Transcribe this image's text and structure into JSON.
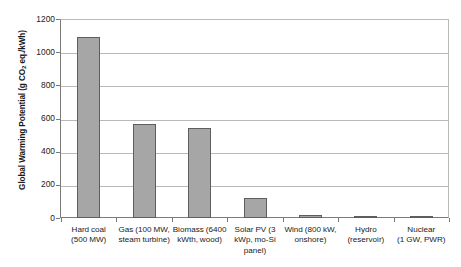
{
  "chart_data": {
    "type": "bar",
    "title": "",
    "subtitle": "",
    "xlabel": "",
    "ylabel": "Global Warming Potential (g CO2 eq./kWh)",
    "ylabel_parts": {
      "before": "Global Warming Potential (g CO",
      "subscript": "2",
      "after": " eq./kWh)"
    },
    "categories": [
      "Hard coal (500 MW)",
      "Gas (100 MW, steam turbine)",
      "Biomass (6400 kWth, wood)",
      "Solar PV (3 kWp, mo-Si panel)",
      "Wind (800 kW, onshore)",
      "Hydro (reservoir)",
      "Nuclear (1 GW, PWR)"
    ],
    "category_lines": [
      [
        "Hard coal",
        "(500 MW)"
      ],
      [
        "Gas (100 MW,",
        "steam turbine)"
      ],
      [
        "Biomass (6400",
        "kWth, wood)"
      ],
      [
        "Solar PV (3",
        "kWp, mo-Si",
        "panel)"
      ],
      [
        "Wind (800 kW,",
        "onshore)"
      ],
      [
        "Hydro",
        "(reservoir)"
      ],
      [
        "Nuclear",
        "(1 GW, PWR)"
      ]
    ],
    "values": [
      1091,
      565,
      542,
      120,
      18,
      11,
      11
    ],
    "ylim": [
      0,
      1200
    ],
    "yticks": [
      0,
      200,
      400,
      600,
      800,
      1000,
      1200
    ],
    "ytick_labels": [
      "0",
      "200",
      "400",
      "600",
      "800",
      "1000",
      "1200"
    ],
    "grid": true,
    "grid_axis": "y",
    "legend": false,
    "legend_position": "none",
    "bar_color": "#a6a6a6",
    "bar_edge_color": "#5e5e5e",
    "axis_color": "#7a7a7a",
    "grid_color": "#b9b9b9",
    "background_color": "#ffffff"
  }
}
